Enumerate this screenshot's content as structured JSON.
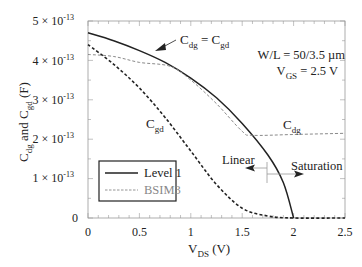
{
  "chart_data": {
    "type": "line",
    "title": "",
    "xlabel": "V_DS (V)",
    "ylabel": "C_dg and C_gd (F)",
    "xlim": [
      0,
      2.5
    ],
    "ylim": [
      0,
      5e-13
    ],
    "xticks": [
      "0",
      "0.5",
      "1",
      "1.5",
      "2",
      "2.5"
    ],
    "yticks": [
      "0",
      "1 × 10^-13",
      "2 × 10^-13",
      "3 × 10^-13",
      "4 × 10^-13",
      "5 × 10^-13"
    ],
    "grid": false,
    "legend_position": "lower-left",
    "series": [
      {
        "name": "Level 1 (C_dg = C_gd)",
        "style": "solid",
        "color": "#222222",
        "x": [
          0,
          0.25,
          0.5,
          0.75,
          1.0,
          1.25,
          1.5,
          1.75,
          1.9,
          2.0
        ],
        "y": [
          4.7e-13,
          4.5e-13,
          4.25e-13,
          3.95e-13,
          3.55e-13,
          3.05e-13,
          2.4e-13,
          1.6e-13,
          9e-14,
          0
        ]
      },
      {
        "name": "Level 1 C_gd (lower dashed)",
        "style": "dashed",
        "color": "#222222",
        "x": [
          0,
          0.25,
          0.5,
          0.75,
          1.0,
          1.25,
          1.5,
          1.75,
          2.0,
          2.5
        ],
        "y": [
          4.4e-13,
          3.9e-13,
          3.3e-13,
          2.55e-13,
          1.7e-13,
          8.5e-14,
          2.5e-14,
          5e-15,
          0,
          0
        ]
      },
      {
        "name": "BSIM3 C_dg",
        "style": "dashed",
        "color": "#888888",
        "x": [
          0,
          0.25,
          0.5,
          0.8,
          1.0,
          1.25,
          1.5,
          1.6,
          2.0,
          2.5
        ],
        "y": [
          4.15e-13,
          4.1e-13,
          3.95e-13,
          3.85e-13,
          3.5e-13,
          2.9e-13,
          2.2e-13,
          2.1e-13,
          2.12e-13,
          2.15e-13
        ]
      }
    ],
    "annotations": [
      {
        "text": "C_dg = C_gd",
        "arrow_to": [
          0.8,
          3.9e-13
        ]
      },
      {
        "text": "W/L = 50/3.5 µm"
      },
      {
        "text": "V_GS = 2.5 V"
      },
      {
        "text": "C_gd",
        "at": [
          0.55,
          2.35e-13
        ]
      },
      {
        "text": "C_dg",
        "at": [
          2.05,
          2.3e-13
        ]
      },
      {
        "text": "Linear",
        "arrow": "left",
        "at_x": 1.75
      },
      {
        "text": "Saturation",
        "arrow": "right",
        "at_x": 1.75
      }
    ],
    "legend": [
      "Level 1",
      "BSIM3"
    ]
  },
  "labels": {
    "y_axis": {
      "main": "C",
      "sub1": "dg",
      "mid": " and C",
      "sub2": "gd",
      "unit": "  (F)"
    },
    "x_axis": {
      "main": "V",
      "sub": "DS",
      "unit": "  (V)"
    },
    "yticks": [
      {
        "mant": "0",
        "exp": ""
      },
      {
        "mant": "1 × 10",
        "exp": "-13"
      },
      {
        "mant": "2 × 10",
        "exp": "-13"
      },
      {
        "mant": "3 × 10",
        "exp": "-13"
      },
      {
        "mant": "4 × 10",
        "exp": "-13"
      },
      {
        "mant": "5 × 10",
        "exp": "-13"
      }
    ],
    "xticks": [
      "0",
      "0.5",
      "1",
      "1.5",
      "2",
      "2.5"
    ],
    "eq_label": {
      "c1": "C",
      "s1": "dg",
      "eq": " = C",
      "s2": "gd"
    },
    "wl": "W/L = 50/3.5 µm",
    "vgs": {
      "main": "V",
      "sub": "GS",
      "rest": " = 2.5 V"
    },
    "cgd": {
      "main": "C",
      "sub": "gd"
    },
    "cdg": {
      "main": "C",
      "sub": "dg"
    },
    "linear": "Linear",
    "saturation": "Saturation",
    "legend": {
      "level1": "Level 1",
      "bsim3": "BSIM3"
    }
  }
}
